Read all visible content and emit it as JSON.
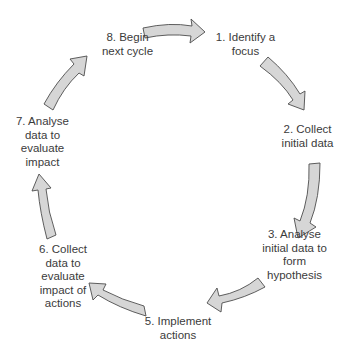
{
  "diagram": {
    "type": "cycle",
    "steps": [
      {
        "id": 1,
        "lines": [
          "1. Identify a",
          "focus"
        ]
      },
      {
        "id": 2,
        "lines": [
          "2. Collect",
          "initial data"
        ]
      },
      {
        "id": 3,
        "lines": [
          "3. Analyse",
          "initial data to",
          "form",
          "hypothesis"
        ]
      },
      {
        "id": 5,
        "lines": [
          "5. Implement",
          "actions"
        ]
      },
      {
        "id": 6,
        "lines": [
          "6. Collect",
          "data to",
          "evaluate",
          "impact of",
          "actions"
        ]
      },
      {
        "id": 7,
        "lines": [
          "7. Analyse",
          "data to",
          "evaluate",
          "impact"
        ]
      },
      {
        "id": 8,
        "lines": [
          "8. Begin",
          "next cycle"
        ]
      }
    ],
    "arrow_count": 7,
    "colors": {
      "arrow_fill": "#d6d6d6",
      "arrow_stroke": "#4d4d4d",
      "text": "#3b3b3b",
      "background": "#ffffff"
    }
  }
}
